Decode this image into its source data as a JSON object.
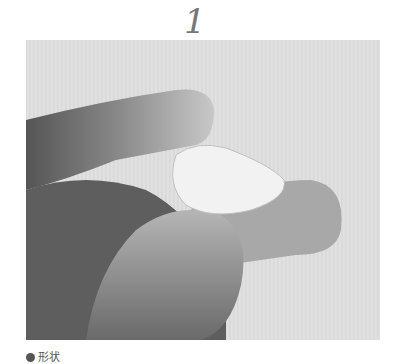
{
  "step": {
    "number": "1"
  },
  "photo": {
    "description": "Fingers pinching a small white teardrop-shaped clay piece, grayscale photo"
  },
  "caption": {
    "label": "形状"
  }
}
